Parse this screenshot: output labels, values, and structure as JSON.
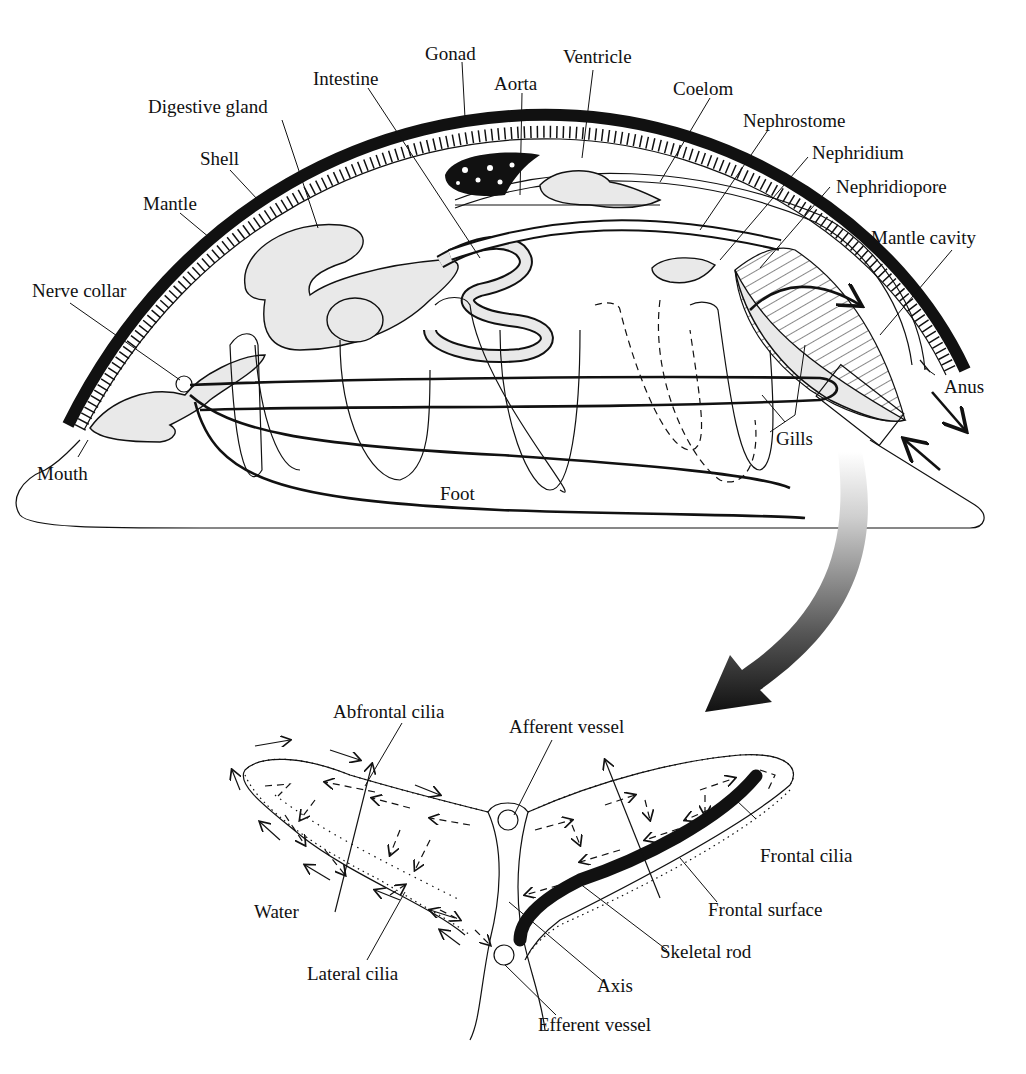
{
  "figure": {
    "body_labels": {
      "gonad": "Gonad",
      "ventricle": "Ventricle",
      "intestine": "Intestine",
      "aorta": "Aorta",
      "coelom": "Coelom",
      "digestive_gland": "Digestive gland",
      "nephrostome": "Nephrostome",
      "nephridium": "Nephridium",
      "shell": "Shell",
      "nephridiopore": "Nephridiopore",
      "mantle": "Mantle",
      "mantle_cavity": "Mantle cavity",
      "nerve_collar": "Nerve collar",
      "anus": "Anus",
      "gills": "Gills",
      "mouth": "Mouth",
      "foot": "Foot"
    },
    "gill_labels": {
      "abfrontal_cilia": "Abfrontal cilia",
      "afferent_vessel": "Afferent vessel",
      "frontal_cilia": "Frontal cilia",
      "water": "Water",
      "frontal_surface": "Frontal surface",
      "skeletal_rod": "Skeletal rod",
      "lateral_cilia": "Lateral cilia",
      "axis": "Axis",
      "efferent_vessel": "Efferent vessel"
    },
    "icons": {
      "zoom_arrow": "curved-gradient-arrow-icon",
      "water_flow_out": "arrow-out-icon",
      "water_flow_in": "arrow-in-icon"
    },
    "colors": {
      "ink": "#111111",
      "background": "#ffffff",
      "stipple": "#e9e9e9"
    }
  }
}
